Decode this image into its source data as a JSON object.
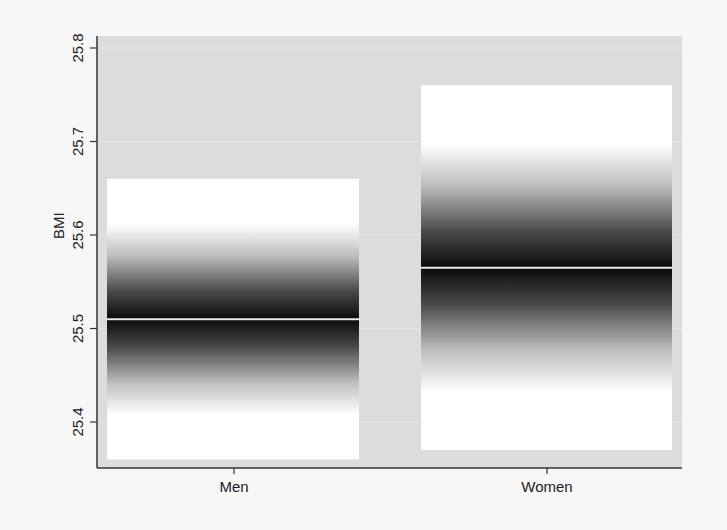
{
  "chart_data": {
    "type": "bar",
    "subtype": "gradient-confidence-bar",
    "title": "",
    "xlabel": "",
    "ylabel": "BMI",
    "categories": [
      "Men",
      "Women"
    ],
    "series": [
      {
        "name": "BMI",
        "mean": [
          25.51,
          25.565
        ],
        "upper": [
          25.66,
          25.76
        ],
        "lower": [
          25.36,
          25.37
        ]
      }
    ],
    "yticks": [
      25.4,
      25.5,
      25.6,
      25.7,
      25.8
    ],
    "ytick_labels": [
      "25.4",
      "25.5",
      "25.6",
      "25.7",
      "25.8"
    ],
    "ylim": [
      25.34,
      25.815
    ],
    "grid": true,
    "legend": null,
    "colors": {
      "page_background": "#f7f7f7",
      "plot_background": "#dcdcdc",
      "gradient_center": "#0a0a0a",
      "gradient_edge": "#ffffff",
      "mean_line": "#e8e8e8",
      "axis": "#333333"
    }
  },
  "layout": {
    "plot": {
      "x0": 97,
      "x1": 682,
      "y0": 36,
      "y1": 468
    },
    "y_px_per_unit": 935,
    "y_ref_value": 25.8,
    "y_ref_px": 48,
    "bars": [
      {
        "x0": 107,
        "x1": 359,
        "tick_x": 234
      },
      {
        "x0": 421,
        "x1": 672,
        "tick_x": 547
      }
    ]
  }
}
